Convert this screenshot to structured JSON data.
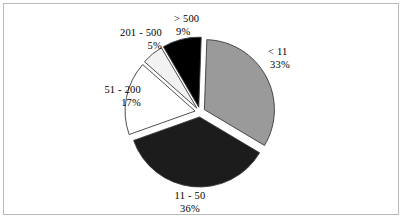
{
  "chart_data": {
    "type": "pie",
    "title": "",
    "subtitle": "",
    "xlabel": "",
    "ylabel": "",
    "legend_position": "none",
    "grid": false,
    "exploded": true,
    "value_unit": "percent",
    "categories": [
      "< 11",
      "11 - 50",
      "51 - 200",
      "201 - 500",
      "> 500"
    ],
    "values": [
      33,
      36,
      17,
      5,
      9
    ],
    "labels": [
      "33%",
      "36%",
      "17%",
      "5%",
      "9%"
    ],
    "slice_colors": [
      "#9a9a9a",
      "#1c1c1c",
      "#ffffff",
      "#f2f2f2",
      "#000000"
    ],
    "slice_outline": "#3a3a3a",
    "slices": [
      {
        "category": "< 11",
        "value": 33,
        "label": "33%",
        "color": "#9a9a9a"
      },
      {
        "category": "11 - 50",
        "value": 36,
        "label": "36%",
        "color": "#1c1c1c"
      },
      {
        "category": "51 - 200",
        "value": 17,
        "label": "17%",
        "color": "#ffffff"
      },
      {
        "category": "201 - 500",
        "value": 5,
        "label": "5%",
        "color": "#f2f2f2"
      },
      {
        "category": "> 500",
        "value": 9,
        "label": "9%",
        "color": "#000000"
      }
    ]
  },
  "figure": {
    "background": "#ffffff",
    "border_color": "#b9b9b9"
  }
}
